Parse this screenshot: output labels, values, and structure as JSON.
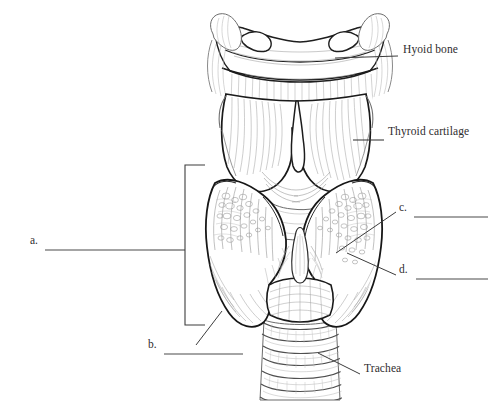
{
  "figure": {
    "background_color": "#ffffff",
    "ink_color": "#3a3a3a",
    "dark_ink_color": "#1c1c1c",
    "shading_color": "#9a9a9a",
    "text_color": "#2f2d2e",
    "leader_color": "#4a4a4a"
  },
  "named_labels": [
    {
      "id": "hyoid-bone",
      "text": "Hyoid bone",
      "text_x": 403,
      "text_y": 50,
      "leader": {
        "x1": 335,
        "y1": 58,
        "x2": 398,
        "y2": 56
      }
    },
    {
      "id": "thyroid-cartilage",
      "text": "Thyroid cartilage",
      "text_x": 388,
      "text_y": 132,
      "leader": {
        "x1": 353,
        "y1": 140,
        "x2": 384,
        "y2": 140
      }
    },
    {
      "id": "trachea",
      "text": "Trachea",
      "text_x": 364,
      "text_y": 369,
      "leader": {
        "x1": 318,
        "y1": 353,
        "x2": 360,
        "y2": 374
      }
    }
  ],
  "blank_labels": [
    {
      "id": "a",
      "letter": "a.",
      "letter_x": 30,
      "letter_y": 241,
      "line": {
        "x1": 45,
        "y1": 250,
        "x2": 150,
        "y2": 250
      },
      "bracket": {
        "x": 185,
        "y_top": 165,
        "y_bottom": 325,
        "stem_x1": 150,
        "stem_x2": 185,
        "stem_y": 250,
        "arm": 20
      }
    },
    {
      "id": "b",
      "letter": "b.",
      "letter_x": 148,
      "letter_y": 345,
      "line": {
        "x1": 164,
        "y1": 354,
        "x2": 243,
        "y2": 354
      },
      "leader": {
        "x1": 196,
        "y1": 345,
        "x2": 222,
        "y2": 311
      }
    },
    {
      "id": "c",
      "letter": "c.",
      "letter_x": 399,
      "letter_y": 208,
      "line": {
        "x1": 414,
        "y1": 217,
        "x2": 488,
        "y2": 217
      },
      "leader": {
        "x1": 336,
        "y1": 253,
        "x2": 396,
        "y2": 212
      }
    },
    {
      "id": "d",
      "letter": "d.",
      "letter_x": 399,
      "letter_y": 270,
      "line": {
        "x1": 416,
        "y1": 279,
        "x2": 488,
        "y2": 279
      },
      "leader": {
        "x1": 347,
        "y1": 253,
        "x2": 396,
        "y2": 275
      }
    }
  ],
  "anatomy_parts": [
    {
      "id": "hyoid-bone",
      "name": "hyoid bone"
    },
    {
      "id": "thyroid-cartilage",
      "name": "thyroid cartilage"
    },
    {
      "id": "thyroid-gland-left-lobe",
      "name": "thyroid gland left lobe"
    },
    {
      "id": "thyroid-gland-right-lobe",
      "name": "thyroid gland right lobe"
    },
    {
      "id": "thyroid-gland-isthmus",
      "name": "thyroid gland isthmus"
    },
    {
      "id": "pyramidal-lobe",
      "name": "pyramidal lobe"
    },
    {
      "id": "cricoid-cartilage",
      "name": "cricoid cartilage"
    },
    {
      "id": "trachea",
      "name": "trachea"
    },
    {
      "id": "thyrohyoid-membrane",
      "name": "thyrohyoid membrane"
    }
  ]
}
